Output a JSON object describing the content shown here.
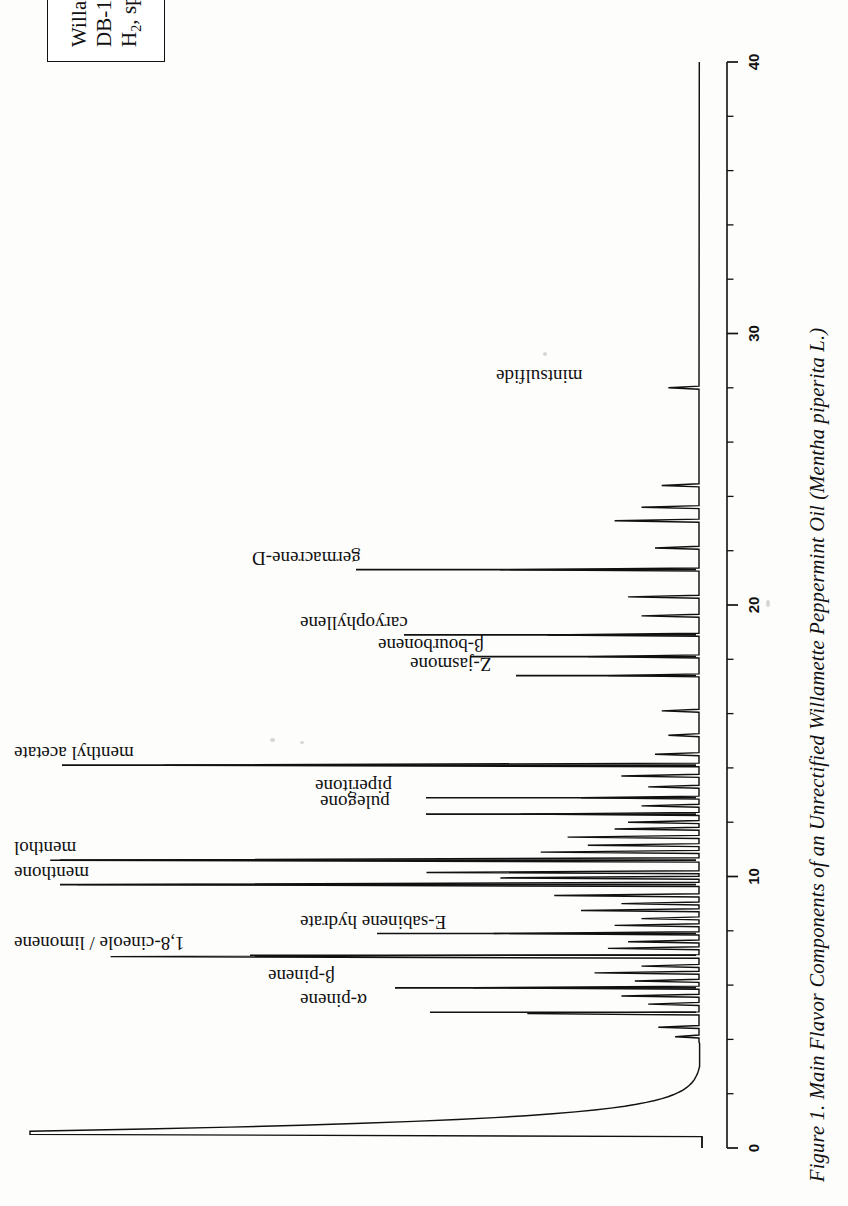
{
  "figure": {
    "caption": "Figure 1. Main Flavor Components of an Unrectified Willamette Peppermint Oil (Mentha piperita L.)",
    "caption_plain": "Figure 1. Main Flavor Components of an Unrectified Willamette Peppermint Oil (Mentha piperita L.)"
  },
  "legend": {
    "line1": "Willamette peppermint oil (crude)",
    "line2": "DB-1 (60m x 0.32mm ID, 0.25µm)",
    "line3_prefix": "H",
    "line3_sub": "2",
    "line3_suffix": ", split 1:50"
  },
  "axis": {
    "label": "",
    "unit": "min",
    "min": 0,
    "max": 40,
    "major_ticks": [
      0,
      10,
      20,
      30,
      40
    ],
    "major_tick_labels": [
      "0",
      "10",
      "20",
      "30",
      "40"
    ],
    "minor_tick_step": 2
  },
  "peak_labels": [
    {
      "name": "α-pinene",
      "rt": 5.0,
      "leader": true
    },
    {
      "name": "β-pinene",
      "rt": 5.9,
      "leader": true
    },
    {
      "name": "1,8-cineole / limonene",
      "rt": 7.1,
      "leader": true
    },
    {
      "name": "E-sabinene hydrate",
      "rt": 7.9,
      "leader": true
    },
    {
      "name": "menthone",
      "rt": 9.7,
      "leader": true
    },
    {
      "name": "menthol",
      "rt": 10.6,
      "leader": true
    },
    {
      "name": "pulegone",
      "rt": 12.3,
      "leader": true
    },
    {
      "name": "piperitone",
      "rt": 12.9,
      "leader": true
    },
    {
      "name": "menthyl acetate",
      "rt": 14.1,
      "leader": true
    },
    {
      "name": "Z-jasmone",
      "rt": 17.4,
      "leader": true
    },
    {
      "name": "β-bourbonene",
      "rt": 18.1,
      "leader": true
    },
    {
      "name": "caryophyllene",
      "rt": 18.9,
      "leader": true
    },
    {
      "name": "germacrene-D",
      "rt": 21.3,
      "leader": true
    },
    {
      "name": "mintsulfide",
      "rt": 28.0,
      "leader": false
    }
  ],
  "chart_data": {
    "type": "line",
    "xlabel": "Retention time (min)",
    "ylabel": "Detector response (FID)",
    "xlim": [
      0,
      40
    ],
    "ylim": [
      0,
      100
    ],
    "grid": false,
    "legend_position": "top-left-box",
    "orientation": "rotated-90-ccw",
    "series_name": "FID signal",
    "annotations": [
      "α-pinene",
      "β-pinene",
      "1,8-cineole / limonene",
      "E-sabinene hydrate",
      "menthone",
      "menthol",
      "pulegone",
      "piperitone",
      "menthyl acetate",
      "Z-jasmone",
      "β-bourbonene",
      "caryophyllene",
      "germacrene-D",
      "mintsulfide"
    ],
    "solvent_front": {
      "rt_start": 0.4,
      "rt_end": 3.6,
      "height": 100,
      "label": "solvent / injection front"
    },
    "peaks": [
      {
        "rt": 0.55,
        "height": 100.0,
        "width": 0.1,
        "label": "solvent front"
      },
      {
        "rt": 4.1,
        "height": 4.0,
        "width": 0.05,
        "label": ""
      },
      {
        "rt": 4.45,
        "height": 6.5,
        "width": 0.05,
        "label": ""
      },
      {
        "rt": 4.95,
        "height": 26.0,
        "width": 0.05,
        "label": "α-pinene"
      },
      {
        "rt": 5.3,
        "height": 8.0,
        "width": 0.05,
        "label": ""
      },
      {
        "rt": 5.6,
        "height": 12.0,
        "width": 0.05,
        "label": ""
      },
      {
        "rt": 5.9,
        "height": 34.0,
        "width": 0.05,
        "label": "β-pinene"
      },
      {
        "rt": 6.15,
        "height": 10.0,
        "width": 0.05,
        "label": ""
      },
      {
        "rt": 6.45,
        "height": 16.0,
        "width": 0.05,
        "label": ""
      },
      {
        "rt": 6.7,
        "height": 9.0,
        "width": 0.05,
        "label": ""
      },
      {
        "rt": 7.05,
        "height": 88.0,
        "width": 0.06,
        "label": "1,8-cineole / limonene"
      },
      {
        "rt": 7.35,
        "height": 14.0,
        "width": 0.05,
        "label": ""
      },
      {
        "rt": 7.6,
        "height": 11.0,
        "width": 0.05,
        "label": ""
      },
      {
        "rt": 7.9,
        "height": 31.0,
        "width": 0.05,
        "label": "E-sabinene hydrate"
      },
      {
        "rt": 8.2,
        "height": 13.0,
        "width": 0.05,
        "label": ""
      },
      {
        "rt": 8.45,
        "height": 9.0,
        "width": 0.05,
        "label": ""
      },
      {
        "rt": 8.75,
        "height": 18.0,
        "width": 0.05,
        "label": ""
      },
      {
        "rt": 9.0,
        "height": 12.0,
        "width": 0.05,
        "label": ""
      },
      {
        "rt": 9.3,
        "height": 22.0,
        "width": 0.05,
        "label": ""
      },
      {
        "rt": 9.7,
        "height": 93.0,
        "width": 0.07,
        "label": "menthone"
      },
      {
        "rt": 9.95,
        "height": 30.0,
        "width": 0.05,
        "label": ""
      },
      {
        "rt": 10.15,
        "height": 41.0,
        "width": 0.05,
        "label": ""
      },
      {
        "rt": 10.6,
        "height": 97.0,
        "width": 0.07,
        "label": "menthol"
      },
      {
        "rt": 10.9,
        "height": 24.0,
        "width": 0.05,
        "label": ""
      },
      {
        "rt": 11.15,
        "height": 17.0,
        "width": 0.05,
        "label": ""
      },
      {
        "rt": 11.45,
        "height": 20.0,
        "width": 0.05,
        "label": ""
      },
      {
        "rt": 11.75,
        "height": 13.0,
        "width": 0.05,
        "label": ""
      },
      {
        "rt": 12.0,
        "height": 11.0,
        "width": 0.05,
        "label": ""
      },
      {
        "rt": 12.3,
        "height": 27.0,
        "width": 0.05,
        "label": "pulegone"
      },
      {
        "rt": 12.6,
        "height": 9.0,
        "width": 0.05,
        "label": ""
      },
      {
        "rt": 12.9,
        "height": 18.0,
        "width": 0.05,
        "label": "piperitone"
      },
      {
        "rt": 13.3,
        "height": 8.0,
        "width": 0.05,
        "label": ""
      },
      {
        "rt": 13.7,
        "height": 12.0,
        "width": 0.05,
        "label": ""
      },
      {
        "rt": 14.1,
        "height": 80.0,
        "width": 0.06,
        "label": "menthyl acetate"
      },
      {
        "rt": 14.5,
        "height": 7.0,
        "width": 0.05,
        "label": ""
      },
      {
        "rt": 15.2,
        "height": 5.0,
        "width": 0.05,
        "label": ""
      },
      {
        "rt": 16.1,
        "height": 6.0,
        "width": 0.05,
        "label": ""
      },
      {
        "rt": 17.4,
        "height": 14.0,
        "width": 0.05,
        "label": "Z-jasmone"
      },
      {
        "rt": 18.1,
        "height": 17.0,
        "width": 0.05,
        "label": "β-bourbonene"
      },
      {
        "rt": 18.9,
        "height": 23.0,
        "width": 0.05,
        "label": "caryophyllene"
      },
      {
        "rt": 19.6,
        "height": 9.0,
        "width": 0.05,
        "label": ""
      },
      {
        "rt": 20.3,
        "height": 11.0,
        "width": 0.05,
        "label": ""
      },
      {
        "rt": 21.3,
        "height": 30.0,
        "width": 0.05,
        "label": "germacrene-D"
      },
      {
        "rt": 22.1,
        "height": 7.0,
        "width": 0.05,
        "label": ""
      },
      {
        "rt": 23.1,
        "height": 13.0,
        "width": 0.05,
        "label": ""
      },
      {
        "rt": 23.6,
        "height": 9.0,
        "width": 0.05,
        "label": ""
      },
      {
        "rt": 24.4,
        "height": 6.0,
        "width": 0.05,
        "label": ""
      },
      {
        "rt": 28.0,
        "height": 5.0,
        "width": 0.05,
        "label": "mintsulfide"
      }
    ]
  }
}
